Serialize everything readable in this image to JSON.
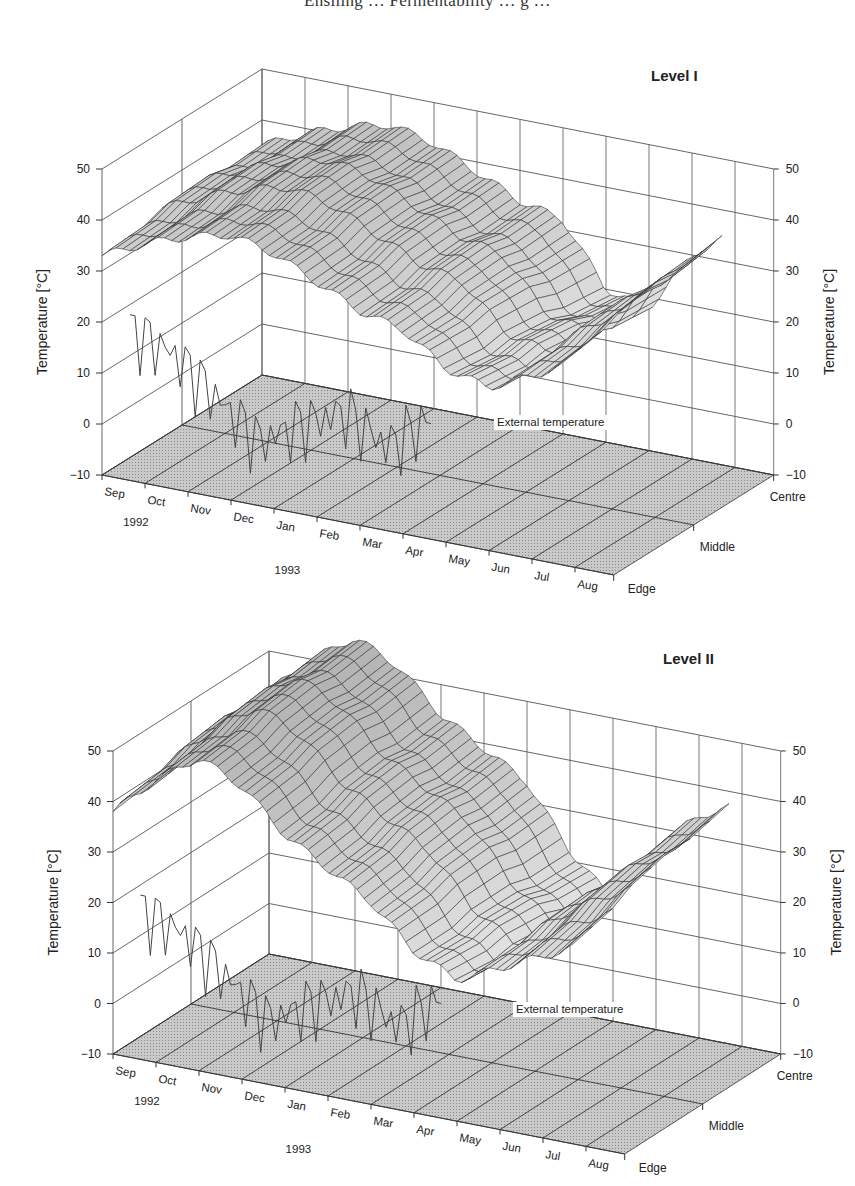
{
  "page": {
    "running_header": "Ensiling … Fermentability … g …"
  },
  "chart_data": [
    {
      "type": "surface3d",
      "title": "Level I",
      "zlabel_left": "Temperature [°C]",
      "zlabel_right": "Temperature [°C]",
      "zlim": [
        -10,
        50
      ],
      "z_ticks": [
        "50",
        "40",
        "30",
        "20",
        "10",
        "0",
        "−10"
      ],
      "x_ticks": [
        "Sep",
        "Oct",
        "Nov",
        "Dec",
        "Jan",
        "Feb",
        "Mar",
        "Apr",
        "May",
        "Jun",
        "Jul",
        "Aug"
      ],
      "x_year_labels": [
        "1992",
        "1993"
      ],
      "y_ticks": [
        "Edge",
        "Middle",
        "Centre"
      ],
      "annotation": "External temperature",
      "grid": true,
      "series": [
        {
          "name": "Edge",
          "values": [
            33,
            37,
            40,
            42,
            40,
            36,
            32,
            30,
            24,
            22,
            26,
            30
          ]
        },
        {
          "name": "Middle",
          "values": [
            34,
            38,
            41,
            43,
            41,
            37,
            33,
            31,
            22,
            20,
            28,
            33
          ]
        },
        {
          "name": "Centre",
          "values": [
            35,
            39,
            42,
            44,
            42,
            38,
            34,
            32,
            20,
            18,
            30,
            36
          ]
        },
        {
          "name": "External temperature",
          "values": [
            15,
            12,
            5,
            -2,
            3,
            7,
            2,
            9,
            14,
            16,
            17,
            15
          ]
        }
      ]
    },
    {
      "type": "surface3d",
      "title": "Level II",
      "zlabel_left": "Temperature [°C]",
      "zlabel_right": "Temperature [°C]",
      "zlim": [
        -10,
        50
      ],
      "z_ticks": [
        "50",
        "40",
        "30",
        "20",
        "10",
        "0",
        "−10"
      ],
      "x_ticks": [
        "Sep",
        "Oct",
        "Nov",
        "Dec",
        "Jan",
        "Feb",
        "Mar",
        "Apr",
        "May",
        "Jun",
        "Jul",
        "Aug"
      ],
      "x_year_labels": [
        "1992",
        "1993"
      ],
      "y_ticks": [
        "Edge",
        "Middle",
        "Centre"
      ],
      "annotation": "External temperature",
      "grid": true,
      "series": [
        {
          "name": "Edge",
          "values": [
            38,
            46,
            52,
            48,
            40,
            35,
            30,
            22,
            18,
            22,
            26,
            30
          ]
        },
        {
          "name": "Middle",
          "values": [
            40,
            48,
            54,
            50,
            42,
            37,
            32,
            22,
            16,
            24,
            30,
            34
          ]
        },
        {
          "name": "Centre",
          "values": [
            42,
            50,
            56,
            52,
            44,
            39,
            34,
            22,
            14,
            26,
            34,
            38
          ]
        },
        {
          "name": "External temperature",
          "values": [
            15,
            12,
            5,
            -2,
            3,
            7,
            2,
            9,
            14,
            16,
            17,
            15
          ]
        }
      ]
    }
  ]
}
